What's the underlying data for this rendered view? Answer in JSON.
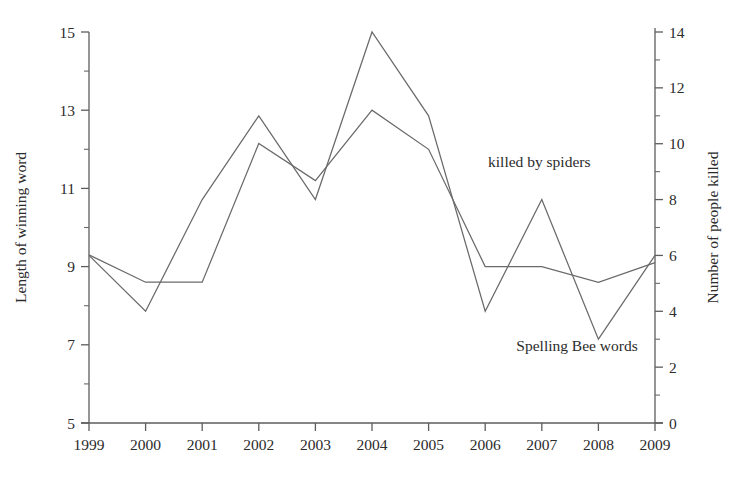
{
  "chart_data": {
    "type": "line",
    "title": "",
    "subtitle": "",
    "xlabel": "",
    "categories": [
      "1999",
      "2000",
      "2001",
      "2002",
      "2003",
      "2004",
      "2005",
      "2006",
      "2007",
      "2008",
      "2009"
    ],
    "grid": false,
    "legend_position": "inline-annotations",
    "axes": {
      "x": {
        "tick_labels": [
          "1999",
          "2000",
          "2001",
          "2002",
          "2003",
          "2004",
          "2005",
          "2006",
          "2007",
          "2008",
          "2009"
        ],
        "xlim": [
          1999,
          2009
        ]
      },
      "y_left": {
        "label": "Length of winning word",
        "ylim": [
          5,
          15
        ],
        "tick_labels": [
          "5",
          "7",
          "9",
          "11",
          "13",
          "15"
        ],
        "tick_values": [
          5,
          7,
          9,
          11,
          13,
          15
        ],
        "minor_tick_values": [
          6,
          8,
          10,
          12,
          14
        ]
      },
      "y_right": {
        "label": "Number of people killed",
        "ylim": [
          0,
          14
        ],
        "tick_labels": [
          "0",
          "2",
          "4",
          "6",
          "8",
          "10",
          "12",
          "14"
        ],
        "tick_values": [
          0,
          2,
          4,
          6,
          8,
          10,
          12,
          14
        ],
        "minor_tick_values": [
          1,
          3,
          5,
          7,
          9,
          11,
          13
        ]
      }
    },
    "series": [
      {
        "name": "Spelling Bee words",
        "axis": "y_left",
        "annotation": "Spelling Bee words",
        "annotation_x": 2006.55,
        "annotation_y_left": 6.85,
        "color": "#6a6a6a",
        "values": [
          9.3,
          8.6,
          8.6,
          12.15,
          11.2,
          13.0,
          12.0,
          9.0,
          9.0,
          8.6,
          9.1
        ]
      },
      {
        "name": "killed by spiders",
        "axis": "y_right",
        "annotation": "killed by spiders",
        "annotation_x": 2006.05,
        "annotation_y_left": 11.55,
        "color": "#6a6a6a",
        "values": [
          6,
          4,
          8,
          11,
          8,
          14,
          11,
          4,
          8,
          3,
          6
        ]
      }
    ]
  },
  "annotations": {
    "spiders_label": "killed by spiders",
    "spelling_label": "Spelling Bee words"
  },
  "style": {
    "axis_color": "#5d5d5d",
    "line_color": "#6a6a6a",
    "text_color": "#2b2b2b",
    "background": "#ffffff"
  }
}
